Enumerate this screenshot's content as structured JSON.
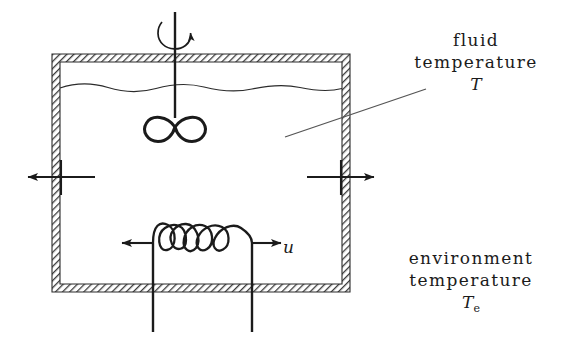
{
  "diagram": {
    "colors": {
      "ink": "#1b1b1b",
      "wall_hatch": "#4a4a4a",
      "wall_fill": "#ffffff",
      "background": "#ffffff"
    },
    "labels": {
      "fluid": {
        "line1": "fluid",
        "line2": "temperature",
        "symbol": "T"
      },
      "environment": {
        "line1": "environment",
        "line2": "temperature",
        "symbol": "T",
        "subscript": "e"
      },
      "input": {
        "symbol": "u"
      }
    },
    "elements": {
      "tank": "tank-vessel",
      "wall_pattern": "diagonal-hatch",
      "fluid_surface": "wavy-line",
      "stirrer_shaft": "vertical-shaft",
      "stirrer_impeller": "infinity-impeller",
      "rotation_arrow": "curved-rotation-arrow",
      "heater_coil": "helical-coil",
      "heat_loss_left": "outward-arrow-left",
      "heat_loss_right": "outward-arrow-right",
      "leader_line": "callout-leader"
    },
    "geometry": {
      "tank_left": 52,
      "tank_top": 54,
      "tank_right": 350,
      "tank_bottom": 292,
      "wall_thickness": 8,
      "fluid_level_y": 88,
      "shaft_x": 175,
      "coil_loops": 5
    }
  }
}
